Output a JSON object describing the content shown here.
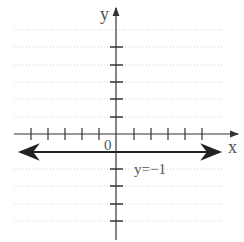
{
  "graph": {
    "x_axis_label": "x",
    "y_axis_label": "y",
    "origin_label": "0",
    "line_label": "y=−1",
    "line_equation": "y = -1",
    "x_ticks_left": 5,
    "x_ticks_right": 5,
    "y_ticks_above": 5,
    "y_ticks_below": 4,
    "colors": {
      "axis": "#333333",
      "line": "#222222",
      "grid": "#bbbbbb",
      "label": "#555555"
    }
  }
}
